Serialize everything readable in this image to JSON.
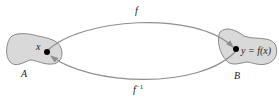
{
  "diagram": {
    "set_a": {
      "label": "A",
      "point_label": "x"
    },
    "set_b": {
      "label": "B",
      "point_label": "y = f(x)"
    },
    "forward_map": {
      "label": "f"
    },
    "inverse_map": {
      "label": "f",
      "superscript": "−1"
    },
    "colors": {
      "blob_fill": "#d9d9d9",
      "blob_stroke": "#8a8a8a",
      "arrow": "#8f8f8f",
      "point": "#000000",
      "text": "#222222"
    }
  }
}
